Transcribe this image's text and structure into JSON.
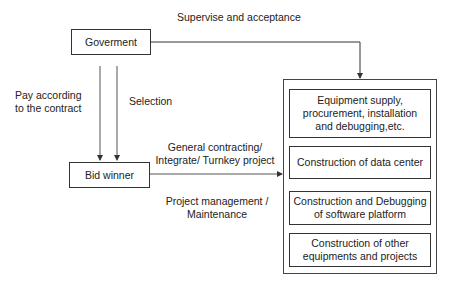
{
  "labels": {
    "supervise": "Supervise and acceptance",
    "pay_line1": "Pay according",
    "pay_line2": "to the contract",
    "selection": "Selection",
    "general_line1": "General contracting/",
    "general_line2": "Integrate/ Turnkey project",
    "pm_line1": "Project management /",
    "pm_line2": "Maintenance"
  },
  "nodes": {
    "government": "Goverment",
    "bid_winner": "Bid winner"
  },
  "scope_items": [
    {
      "line1": "Equipment supply,",
      "line2": "procurement, installation",
      "line3": "and debugging,etc."
    },
    {
      "line1": "Construction of data center"
    },
    {
      "line1": "Construction and Debugging",
      "line2": "of software platform"
    },
    {
      "line1": "Construction of other",
      "line2": "equipments and projects"
    }
  ]
}
